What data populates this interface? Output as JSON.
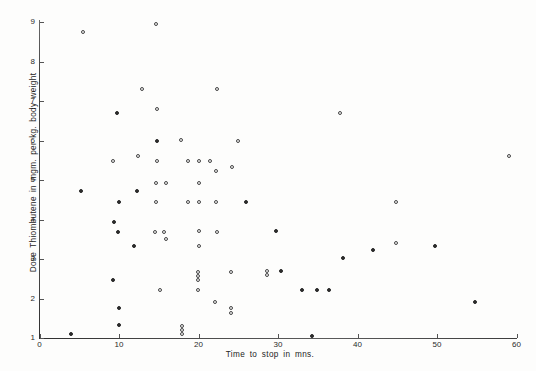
{
  "figure": {
    "background_color": "#fdfdfc",
    "ink_color": "#3a3a3a"
  },
  "chart_data": {
    "type": "scatter",
    "title": "",
    "xlabel": "Time  to  stop  in  mns.",
    "ylabel": "Dose  Thiombutene  in  mgm.  per  kg.  body  weight",
    "xlim": [
      0,
      60
    ],
    "ylim": [
      1,
      9
    ],
    "xticks": [
      0,
      10,
      20,
      30,
      40,
      50,
      60
    ],
    "yticks": [
      1,
      2,
      3,
      4,
      5,
      6,
      7,
      8,
      9
    ],
    "grid": false,
    "legend": null,
    "marker": "circle",
    "n_points": 88,
    "points": [
      {
        "x": 5.5,
        "y": 8.75,
        "style": "open"
      },
      {
        "x": 14.7,
        "y": 8.95,
        "style": "open"
      },
      {
        "x": 12.9,
        "y": 7.3,
        "style": "open"
      },
      {
        "x": 22.3,
        "y": 7.3,
        "style": "open"
      },
      {
        "x": 9.8,
        "y": 6.7,
        "style": "filled"
      },
      {
        "x": 14.8,
        "y": 6.8,
        "style": "open"
      },
      {
        "x": 14.8,
        "y": 6.0,
        "style": "filled"
      },
      {
        "x": 17.8,
        "y": 6.02,
        "style": "open"
      },
      {
        "x": 25.0,
        "y": 6.0,
        "style": "open"
      },
      {
        "x": 37.8,
        "y": 6.7,
        "style": "open"
      },
      {
        "x": 59.0,
        "y": 5.6,
        "style": "open"
      },
      {
        "x": 9.3,
        "y": 5.48,
        "style": "open"
      },
      {
        "x": 12.4,
        "y": 5.6,
        "style": "open"
      },
      {
        "x": 14.8,
        "y": 5.48,
        "style": "open"
      },
      {
        "x": 18.7,
        "y": 5.48,
        "style": "open"
      },
      {
        "x": 20.1,
        "y": 5.48,
        "style": "open"
      },
      {
        "x": 21.4,
        "y": 5.48,
        "style": "open"
      },
      {
        "x": 24.2,
        "y": 5.32,
        "style": "open"
      },
      {
        "x": 22.2,
        "y": 5.22,
        "style": "open"
      },
      {
        "x": 5.2,
        "y": 4.72,
        "style": "filled"
      },
      {
        "x": 12.3,
        "y": 4.72,
        "style": "filled"
      },
      {
        "x": 14.7,
        "y": 4.92,
        "style": "open"
      },
      {
        "x": 15.9,
        "y": 4.92,
        "style": "open"
      },
      {
        "x": 20.0,
        "y": 4.92,
        "style": "open"
      },
      {
        "x": 10.0,
        "y": 4.44,
        "style": "filled"
      },
      {
        "x": 14.7,
        "y": 4.44,
        "style": "open"
      },
      {
        "x": 18.7,
        "y": 4.44,
        "style": "open"
      },
      {
        "x": 20.1,
        "y": 4.44,
        "style": "open"
      },
      {
        "x": 22.2,
        "y": 4.44,
        "style": "open"
      },
      {
        "x": 26.0,
        "y": 4.44,
        "style": "filled"
      },
      {
        "x": 44.8,
        "y": 4.45,
        "style": "open"
      },
      {
        "x": 9.4,
        "y": 3.93,
        "style": "filled"
      },
      {
        "x": 9.9,
        "y": 3.68,
        "style": "filled"
      },
      {
        "x": 14.5,
        "y": 3.68,
        "style": "open"
      },
      {
        "x": 15.7,
        "y": 3.68,
        "style": "open"
      },
      {
        "x": 20.0,
        "y": 3.7,
        "style": "open"
      },
      {
        "x": 22.3,
        "y": 3.68,
        "style": "open"
      },
      {
        "x": 15.9,
        "y": 3.5,
        "style": "open"
      },
      {
        "x": 11.9,
        "y": 3.33,
        "style": "filled"
      },
      {
        "x": 20.0,
        "y": 3.32,
        "style": "open"
      },
      {
        "x": 29.8,
        "y": 3.7,
        "style": "filled"
      },
      {
        "x": 38.2,
        "y": 3.02,
        "style": "filled"
      },
      {
        "x": 41.9,
        "y": 3.22,
        "style": "filled"
      },
      {
        "x": 44.8,
        "y": 3.4,
        "style": "open"
      },
      {
        "x": 49.8,
        "y": 3.32,
        "style": "filled"
      },
      {
        "x": 9.3,
        "y": 2.47,
        "style": "filled"
      },
      {
        "x": 19.9,
        "y": 2.68,
        "style": "open"
      },
      {
        "x": 19.9,
        "y": 2.58,
        "style": "open"
      },
      {
        "x": 19.9,
        "y": 2.48,
        "style": "open"
      },
      {
        "x": 24.1,
        "y": 2.68,
        "style": "open"
      },
      {
        "x": 28.6,
        "y": 2.7,
        "style": "open"
      },
      {
        "x": 28.6,
        "y": 2.6,
        "style": "open"
      },
      {
        "x": 30.4,
        "y": 2.7,
        "style": "filled"
      },
      {
        "x": 33.0,
        "y": 2.22,
        "style": "filled"
      },
      {
        "x": 34.9,
        "y": 2.22,
        "style": "filled"
      },
      {
        "x": 36.4,
        "y": 2.22,
        "style": "filled"
      },
      {
        "x": 15.1,
        "y": 2.22,
        "style": "open"
      },
      {
        "x": 19.9,
        "y": 2.22,
        "style": "open"
      },
      {
        "x": 22.1,
        "y": 1.92,
        "style": "open"
      },
      {
        "x": 54.8,
        "y": 1.9,
        "style": "filled"
      },
      {
        "x": 10.0,
        "y": 1.77,
        "style": "filled"
      },
      {
        "x": 24.1,
        "y": 1.75,
        "style": "open"
      },
      {
        "x": 24.1,
        "y": 1.63,
        "style": "open"
      },
      {
        "x": 10.0,
        "y": 1.34,
        "style": "filled"
      },
      {
        "x": 17.9,
        "y": 1.3,
        "style": "open"
      },
      {
        "x": 17.9,
        "y": 1.2,
        "style": "open"
      },
      {
        "x": 17.9,
        "y": 1.1,
        "style": "open"
      },
      {
        "x": 3.9,
        "y": 1.1,
        "style": "filled"
      },
      {
        "x": 34.3,
        "y": 1.05,
        "style": "filled"
      }
    ]
  },
  "axes": {
    "x_tick_labels": [
      "0",
      "10",
      "20",
      "30",
      "40",
      "50",
      "60"
    ],
    "y_tick_labels": [
      "1",
      "2",
      "3",
      "4",
      "5",
      "6",
      "7",
      "8",
      "9"
    ]
  }
}
